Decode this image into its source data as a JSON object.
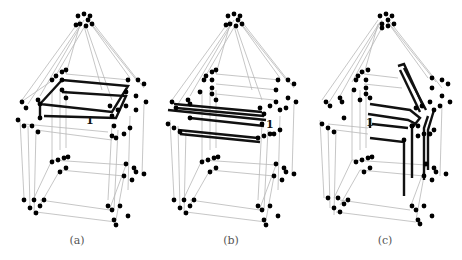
{
  "figure": {
    "panels": [
      {
        "id": "a",
        "caption": "(a)",
        "edge_label": "1",
        "highlight": "top rectangular cycle (two nested squares)"
      },
      {
        "id": "b",
        "caption": "(b)",
        "edge_label": "1",
        "highlight": "parallel horizontal edges on upper floor"
      },
      {
        "id": "c",
        "caption": "(c)",
        "edge_label": "1",
        "highlight": "L-shaped paths descending from roof ridge"
      }
    ]
  },
  "colors": {
    "background": "#ffffff",
    "thin_edge": "#b8b8b8",
    "thick_edge": "#111111",
    "vertex": "#000000",
    "caption": "#555555"
  }
}
